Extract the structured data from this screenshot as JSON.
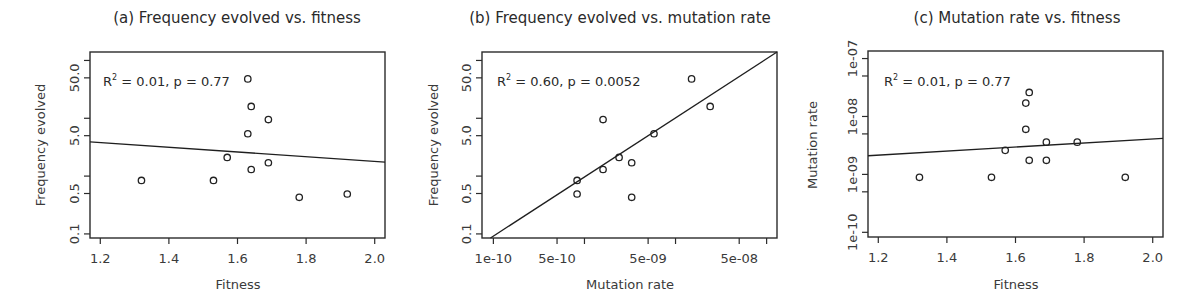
{
  "chart_data": [
    {
      "type": "scatter",
      "panel": "a",
      "title": "(a)  Frequency evolved vs. fitness",
      "xlabel": "Fitness",
      "ylabel": "Frequency evolved",
      "xscale": "linear",
      "yscale": "log",
      "xlim": [
        1.17,
        2.03
      ],
      "ylim": [
        0.085,
        140
      ],
      "xticks": [
        1.2,
        1.4,
        1.6,
        1.8,
        2.0
      ],
      "xtick_labels": [
        "1.2",
        "1.4",
        "1.6",
        "1.8",
        "2.0"
      ],
      "yticks": [
        0.1,
        0.5,
        1,
        5,
        10,
        50,
        100
      ],
      "ytick_labels": [
        "0.1",
        "0.5",
        "",
        "5.0",
        "",
        "50.0",
        ""
      ],
      "annotation": "R² = 0.01, p = 0.77",
      "annotation_r2": "R",
      "annotation_rest": " = 0.01, p = 0.77",
      "grid": false,
      "x": [
        1.32,
        1.53,
        1.57,
        1.63,
        1.63,
        1.64,
        1.64,
        1.69,
        1.69,
        1.78,
        1.92
      ],
      "y": [
        0.84,
        0.84,
        2.1,
        48,
        5.4,
        16,
        1.3,
        9.5,
        1.7,
        0.43,
        0.49
      ],
      "fit_line": {
        "x": [
          1.17,
          2.03
        ],
        "y": [
          3.9,
          1.75
        ]
      }
    },
    {
      "type": "scatter",
      "panel": "b",
      "title": "(b)  Frequency evolved vs. mutation rate",
      "xlabel": "Mutation rate",
      "ylabel": "Frequency evolved",
      "xscale": "log",
      "yscale": "log",
      "xlim": [
        7.5e-11,
        1.3e-07
      ],
      "ylim": [
        0.085,
        140
      ],
      "xticks": [
        1e-10,
        5e-10,
        1e-09,
        5e-09,
        1e-08,
        5e-08,
        1e-07
      ],
      "xtick_labels": [
        "1e-10",
        "5e-10",
        "",
        "5e-09",
        "",
        "5e-08",
        ""
      ],
      "yticks": [
        0.1,
        0.5,
        1,
        5,
        10,
        50,
        100
      ],
      "ytick_labels": [
        "0.1",
        "0.5",
        "",
        "5.0",
        "",
        "50.0",
        ""
      ],
      "annotation": "R² = 0.60, p = 0.0052",
      "annotation_r2": "R",
      "annotation_rest": " = 0.60, p = 0.0052",
      "grid": false,
      "x": [
        8.3e-10,
        8.3e-10,
        1.6e-09,
        1.6e-09,
        2.4e-09,
        3.3e-09,
        3.3e-09,
        5.8e-09,
        1.5e-08,
        2.4e-08
      ],
      "y": [
        0.84,
        0.49,
        1.3,
        9.5,
        2.1,
        1.7,
        0.43,
        5.4,
        48,
        16
      ],
      "fit_line": {
        "x": [
          9.3e-11,
          1.3e-07
        ],
        "y": [
          0.085,
          140
        ]
      }
    },
    {
      "type": "scatter",
      "panel": "c",
      "title": "(c)  Mutation rate vs. fitness",
      "xlabel": "Fitness",
      "ylabel": "Mutation rate",
      "xscale": "linear",
      "yscale": "log",
      "xlim": [
        1.17,
        2.03
      ],
      "ylim": [
        8.3e-11,
        1.35e-07
      ],
      "xticks": [
        1.2,
        1.4,
        1.6,
        1.8,
        2.0
      ],
      "xtick_labels": [
        "1.2",
        "1.4",
        "1.6",
        "1.8",
        "2.0"
      ],
      "yticks": [
        1e-10,
        5e-10,
        1e-09,
        5e-09,
        1e-08,
        5e-08,
        1e-07
      ],
      "ytick_labels": [
        "1e-10",
        "",
        "1e-09",
        "",
        "1e-08",
        "",
        "1e-07"
      ],
      "annotation": "R² = 0.01, p = 0.77",
      "annotation_r2": "R",
      "annotation_rest": " = 0.01, p = 0.77",
      "grid": false,
      "x": [
        1.32,
        1.53,
        1.57,
        1.63,
        1.63,
        1.64,
        1.64,
        1.69,
        1.69,
        1.78,
        1.92
      ],
      "y": [
        8.9e-10,
        8.9e-10,
        2.6e-09,
        1.7e-08,
        6e-09,
        2.6e-08,
        1.75e-09,
        1.75e-09,
        3.6e-09,
        3.6e-09,
        8.9e-10
      ],
      "fit_line": {
        "x": [
          1.17,
          2.03
        ],
        "y": [
          2.1e-09,
          4.2e-09
        ]
      }
    }
  ]
}
